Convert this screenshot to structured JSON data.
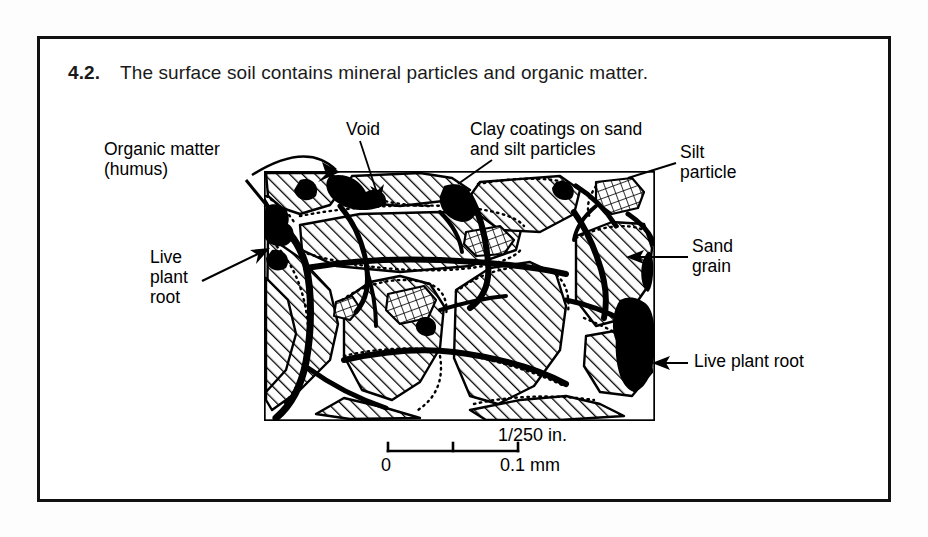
{
  "figure": {
    "number": "4.2.",
    "caption": "The surface soil contains mineral particles and organic matter."
  },
  "labels": {
    "organic_matter": "Organic matter\n(humus)",
    "void": "Void",
    "clay_coatings": "Clay coatings on sand\nand silt particles",
    "silt_particle": "Silt\nparticle",
    "sand_grain": "Sand\ngrain",
    "live_plant_root_left": "Live\nplant\nroot",
    "live_plant_root_right": "Live plant root"
  },
  "scale_bar": {
    "top_label": "1/250 in.",
    "left_label": "0",
    "right_label": "0.1 mm"
  },
  "colors": {
    "ink": "#000000",
    "page": "#ffffff",
    "border": "#111111"
  }
}
